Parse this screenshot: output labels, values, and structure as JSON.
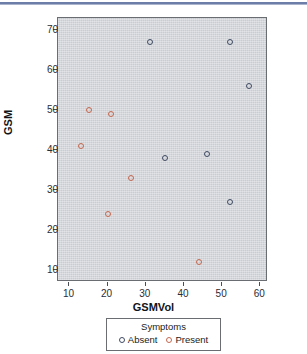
{
  "chart_data": {
    "type": "scatter",
    "title": "",
    "xlabel": "GSMVol",
    "ylabel": "GSM",
    "xlim": [
      7,
      62
    ],
    "ylim": [
      7,
      73
    ],
    "xticks": [
      10,
      20,
      30,
      40,
      50,
      60
    ],
    "yticks": [
      10,
      20,
      30,
      40,
      50,
      60,
      70
    ],
    "grid": false,
    "legend": {
      "title": "Symptoms",
      "position": "below-axes",
      "entries": [
        {
          "label": "Absent",
          "color": "#3f4a63",
          "marker": "open-circle"
        },
        {
          "label": "Present",
          "color": "#c4684f",
          "marker": "open-circle"
        }
      ]
    },
    "series": [
      {
        "name": "Absent",
        "color": "#3f4a63",
        "points": [
          {
            "x": 31,
            "y": 67
          },
          {
            "x": 35,
            "y": 38
          },
          {
            "x": 46,
            "y": 39
          },
          {
            "x": 52,
            "y": 67
          },
          {
            "x": 52,
            "y": 27
          },
          {
            "x": 57,
            "y": 56
          }
        ]
      },
      {
        "name": "Present",
        "color": "#c4684f",
        "points": [
          {
            "x": 13,
            "y": 41
          },
          {
            "x": 15,
            "y": 50
          },
          {
            "x": 20,
            "y": 24
          },
          {
            "x": 21,
            "y": 49
          },
          {
            "x": 26,
            "y": 33
          },
          {
            "x": 44,
            "y": 12
          }
        ]
      }
    ]
  },
  "colors": {
    "panel_background": "#c9ccd1",
    "panel_border": "#6a6d72",
    "absent": "#3f4a63",
    "present": "#c4684f",
    "rule": "#6c7da8"
  }
}
